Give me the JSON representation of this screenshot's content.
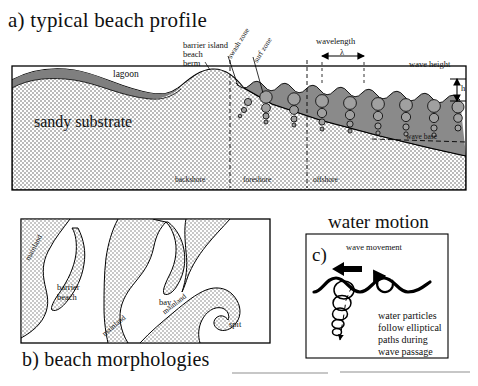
{
  "figure": {
    "panels": [
      {
        "id": "a",
        "letter": "a)",
        "title": "typical beach profile",
        "full_title": "a) typical beach profile",
        "labels": {
          "lagoon": "lagoon",
          "barrier_island": "barrier island",
          "beach": "beach",
          "berm": "berm",
          "swash_zone": "swash zone",
          "surf_zone": "surf zone",
          "wavelength": "wavelength",
          "lambda_symbol": "λ",
          "wave_height": "wave height",
          "wave_height_symbol": "h",
          "sandy_substrate": "sandy substrate",
          "wave_base": "wave base",
          "backshore": "backshore",
          "foreshore": "foreshore",
          "offshore": "offshore"
        }
      },
      {
        "id": "b",
        "letter": "b)",
        "title": "beach morphologies",
        "full_title": "b) beach morphologies",
        "labels": {
          "mainland_left": "mainland",
          "barrier_beach_line1": "barrier",
          "barrier_beach_line2": "beach",
          "mainland_center": "mainland",
          "bay": "bay",
          "mainland_right": "mainland",
          "spit": "spit"
        }
      },
      {
        "id": "c",
        "letter": "c)",
        "title": "water motion",
        "labels": {
          "wave_movement": "wave movement",
          "caption_line1": "water particles",
          "caption_line2": "follow elliptical",
          "caption_line3": "paths during",
          "caption_line4": "wave passage"
        }
      }
    ],
    "colors": {
      "water": "#8a8a8a",
      "sand_stipple": "#d9d9d9",
      "outline": "#000000",
      "background": "#ffffff",
      "orbital_fill": "#9a9a9a"
    }
  }
}
